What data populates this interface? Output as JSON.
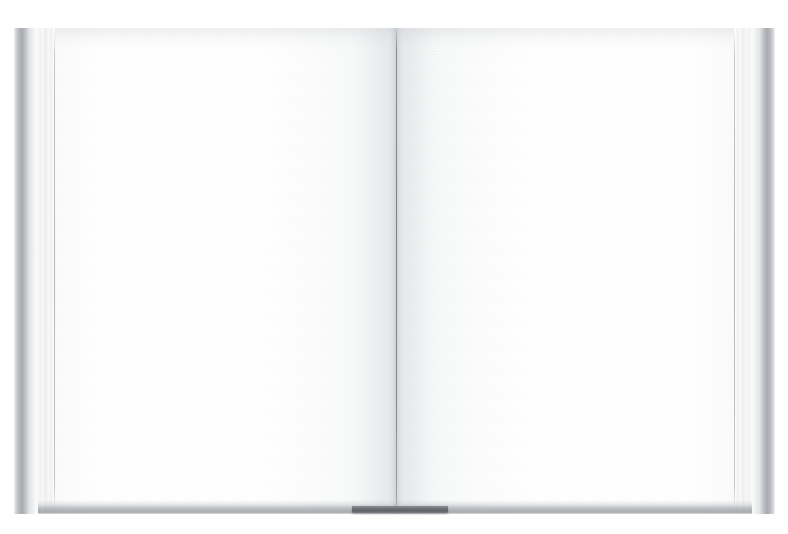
{
  "scene": {
    "kind": "photograph",
    "subject": "open blank book spread",
    "background_color": "#ffffff",
    "width": 788,
    "height": 534,
    "caption": "",
    "visible_text": ""
  },
  "book": {
    "state_label": "open",
    "content_label": "",
    "page_count_visible": 2,
    "paper_color": "#fdfdfe",
    "page_edge_color": "#eceded",
    "cover_color": "#a8abb0",
    "gutter_color": "#767a81",
    "shadow_color": "#6e7278",
    "left_page": {
      "name_label": "verso",
      "text": "",
      "page_number": ""
    },
    "right_page": {
      "name_label": "recto",
      "text": "",
      "page_number": ""
    },
    "bookmark": {
      "label": "",
      "color": "#5f6368"
    }
  }
}
